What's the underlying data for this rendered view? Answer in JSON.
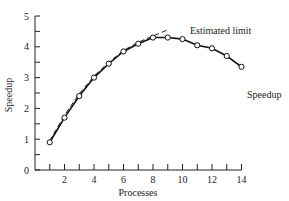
{
  "chart_data": {
    "type": "line",
    "title": "",
    "xlabel": "Processes",
    "ylabel": "Speedup",
    "xlim": [
      0,
      14
    ],
    "ylim": [
      0,
      5
    ],
    "x_ticks": [
      2,
      4,
      6,
      8,
      10,
      12,
      14
    ],
    "y_ticks": [
      0,
      1,
      2,
      3,
      4,
      5
    ],
    "grid": false,
    "legend": "inline labels",
    "series": [
      {
        "name": "Speedup",
        "style": "solid line with open circle markers",
        "x": [
          1,
          2,
          3,
          4,
          5,
          6,
          7,
          8,
          9,
          10,
          11,
          12,
          13,
          14
        ],
        "values": [
          0.9,
          1.7,
          2.4,
          3.0,
          3.45,
          3.85,
          4.1,
          4.3,
          4.3,
          4.25,
          4.05,
          3.95,
          3.7,
          3.35
        ]
      },
      {
        "name": "Estimated limit",
        "style": "dashed line",
        "x": [
          1,
          2,
          3,
          4,
          5,
          6,
          7,
          8,
          9
        ],
        "values": [
          0.95,
          1.78,
          2.48,
          3.05,
          3.5,
          3.88,
          4.15,
          4.35,
          4.55
        ]
      }
    ],
    "annotations": [
      {
        "text": "Estimated limit",
        "x": 9.3,
        "y": 4.6
      },
      {
        "text": "Speedup",
        "x": 14.3,
        "y": 3.35
      }
    ]
  }
}
